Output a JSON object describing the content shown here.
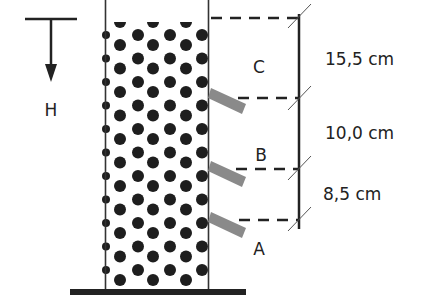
{
  "diagram": {
    "depth_axis_label": "H",
    "points": [
      {
        "id": "C",
        "label": "C"
      },
      {
        "id": "B",
        "label": "B"
      },
      {
        "id": "A",
        "label": "A"
      }
    ],
    "segments": [
      {
        "from": "top",
        "to": "C-B",
        "label": "15,5 cm"
      },
      {
        "from": "C-B",
        "to": "B-A",
        "label": "10,0 cm"
      },
      {
        "from": "B-A",
        "to": "A",
        "label": "8,5 cm"
      }
    ],
    "colors": {
      "line": "#222222",
      "particle": "#1e1e1e",
      "tube": "#8a8a8a",
      "background": "#ffffff"
    }
  }
}
